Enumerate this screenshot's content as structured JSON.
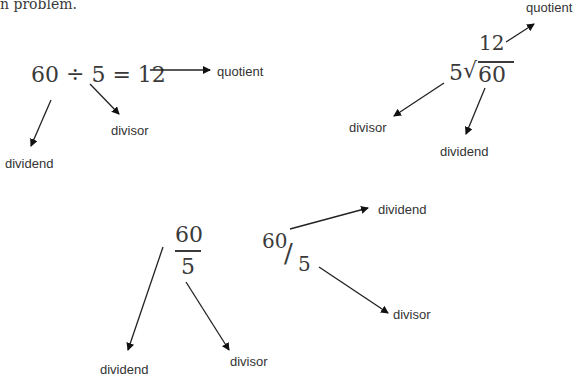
{
  "intro_fragment": "n problem.",
  "notation_1": {
    "expression": "60 ÷ 5 = 12",
    "labels": {
      "quotient": "quotient",
      "divisor": "divisor",
      "dividend": "dividend"
    }
  },
  "notation_2": {
    "quotient": "12",
    "divisor": "5",
    "radical": "√",
    "dividend": "60",
    "labels": {
      "quotient": "quotient",
      "divisor": "divisor",
      "dividend": "dividend"
    }
  },
  "notation_3": {
    "numerator": "60",
    "denominator": "5",
    "labels": {
      "dividend": "dividend",
      "divisor": "divisor"
    }
  },
  "notation_4": {
    "numerator": "60",
    "slash": "/",
    "denominator": "5",
    "labels": {
      "dividend": "dividend",
      "divisor": "divisor"
    }
  }
}
